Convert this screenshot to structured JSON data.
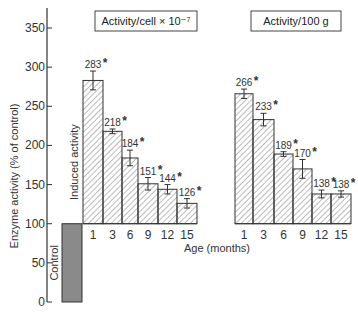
{
  "chart_data": {
    "type": "bar",
    "ylabel": "Enzyme activity (% of control)",
    "xlabel": "Age (months)",
    "ylim": [
      0,
      350
    ],
    "yticks": [
      0,
      50,
      100,
      150,
      200,
      250,
      300,
      350
    ],
    "grid": false,
    "control": {
      "label": "Control",
      "value": 100,
      "color": "#8a8a8a"
    },
    "induced_label": "Induced activity",
    "significance_marker": "*",
    "panels": [
      {
        "title": "Activity/cell × 10⁻⁷",
        "categories": [
          "1",
          "3",
          "6",
          "9",
          "12",
          "15"
        ],
        "values": [
          283,
          218,
          184,
          151,
          144,
          126
        ],
        "value_labels": [
          "283",
          "218",
          "184",
          "151",
          "144",
          "126"
        ],
        "error": [
          12,
          3,
          10,
          8,
          6,
          6
        ]
      },
      {
        "title": "Activity/100 g",
        "categories": [
          "1",
          "3",
          "6",
          "9",
          "12",
          "15"
        ],
        "values": [
          266,
          233,
          189,
          170,
          138,
          138
        ],
        "value_labels": [
          "266",
          "233",
          "189",
          "170",
          "138",
          "138"
        ],
        "error": [
          6,
          8,
          3,
          12,
          5,
          4
        ]
      }
    ]
  }
}
